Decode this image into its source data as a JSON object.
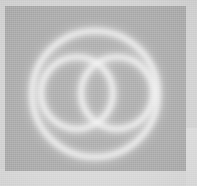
{
  "image": {
    "width": 197,
    "height": 186,
    "kind": "scanned-logo-mark",
    "alt_text": "Blurred grayscale logo: one large circle enclosing two overlapping circles"
  },
  "palette": {
    "paper": "#d3d3d3",
    "plate_gray": "#ababab",
    "stroke_light": "#ececec",
    "stroke_core": "#f4f4f4",
    "bottom_band": "#d8d8d8",
    "right_band": "#dcdcdc"
  },
  "plate": {
    "x": 5,
    "y": 6,
    "width": 181,
    "height": 165
  },
  "mark": {
    "name": "overlapping-circles-mark",
    "outer_circle": {
      "cx": 95,
      "cy": 94,
      "r": 63,
      "stroke_width": 5
    },
    "left_circle": {
      "cx": 77,
      "cy": 93,
      "r": 36,
      "stroke_width": 5
    },
    "right_circle": {
      "cx": 117,
      "cy": 93,
      "r": 36,
      "stroke_width": 5
    },
    "intersections": [
      {
        "x": 97,
        "y": 58
      },
      {
        "x": 97,
        "y": 128
      }
    ]
  },
  "bands": {
    "bottom": {
      "y": 169,
      "height": 17
    },
    "right": {
      "x": 186,
      "y": 128,
      "width": 11
    }
  }
}
